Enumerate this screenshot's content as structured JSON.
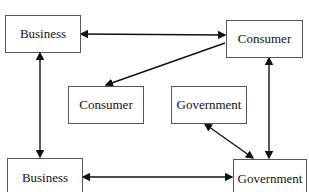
{
  "nodes": {
    "business_top": {
      "label": "Business"
    },
    "consumer_top": {
      "label": "Consumer"
    },
    "consumer_mid": {
      "label": "Consumer"
    },
    "government_mid": {
      "label": "Government"
    },
    "business_bottom": {
      "label": "Business"
    },
    "government_bottom": {
      "label": "Government"
    }
  },
  "edges": [
    {
      "from": "business_top",
      "to": "consumer_top",
      "direction": "both"
    },
    {
      "from": "consumer_top",
      "to": "consumer_mid",
      "direction": "forward"
    },
    {
      "from": "business_top",
      "to": "business_bottom",
      "direction": "both"
    },
    {
      "from": "consumer_top",
      "to": "government_bottom",
      "direction": "both"
    },
    {
      "from": "government_bottom",
      "to": "government_mid",
      "direction": "both"
    },
    {
      "from": "business_bottom",
      "to": "government_bottom",
      "direction": "both"
    }
  ]
}
